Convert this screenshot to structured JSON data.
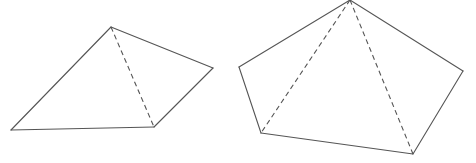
{
  "diagram": {
    "width": 476,
    "height": 163,
    "background": "#ffffff",
    "stroke_color": "#555555",
    "figures": [
      {
        "name": "quadrilateral-pyramid-left",
        "description": "Quadrilateral with one dashed diagonal",
        "vertices": [
          [
            111,
            27
          ],
          [
            213,
            68
          ],
          [
            154,
            127
          ],
          [
            11,
            130
          ]
        ],
        "solid_edges": [
          [
            [
              111,
              27
            ],
            [
              213,
              68
            ]
          ],
          [
            [
              213,
              68
            ],
            [
              154,
              127
            ]
          ],
          [
            [
              154,
              127
            ],
            [
              11,
              130
            ]
          ],
          [
            [
              11,
              130
            ],
            [
              111,
              27
            ]
          ]
        ],
        "dashed_edges": [
          [
            [
              111,
              27
            ],
            [
              154,
              127
            ]
          ]
        ]
      },
      {
        "name": "pentagon-right",
        "description": "Pentagon with two dashed diagonals from the apex",
        "vertices": [
          [
            350,
            0
          ],
          [
            463,
            71
          ],
          [
            413,
            154
          ],
          [
            261,
            133
          ],
          [
            239,
            67
          ]
        ],
        "solid_edges": [
          [
            [
              350,
              0
            ],
            [
              463,
              71
            ]
          ],
          [
            [
              463,
              71
            ],
            [
              413,
              154
            ]
          ],
          [
            [
              413,
              154
            ],
            [
              261,
              133
            ]
          ],
          [
            [
              261,
              133
            ],
            [
              239,
              67
            ]
          ],
          [
            [
              239,
              67
            ],
            [
              350,
              0
            ]
          ]
        ],
        "dashed_edges": [
          [
            [
              350,
              0
            ],
            [
              261,
              133
            ]
          ],
          [
            [
              350,
              0
            ],
            [
              413,
              154
            ]
          ]
        ]
      }
    ]
  }
}
